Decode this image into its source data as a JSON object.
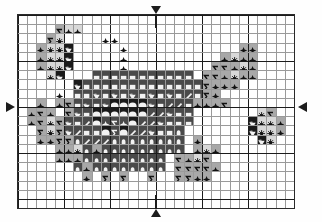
{
  "chart_type": "cross-stitch-pattern-chart",
  "title": "",
  "grid": {
    "columns": 30,
    "rows": 21,
    "cell_size_px": 9.2,
    "bold_line_every": 5,
    "grid_line_color": "#9a9a9a",
    "bold_line_color": "#1c1c1c",
    "background_color": "#ffffff"
  },
  "legend": {
    "symbols": [
      {
        "key": "star",
        "glyph": "four-pointed-star",
        "name": "star-symbol"
      },
      {
        "key": "sigma",
        "glyph": "sigma",
        "name": "sigma-symbol"
      },
      {
        "key": "flower",
        "glyph": "flower",
        "name": "flower-symbol"
      },
      {
        "key": "square",
        "glyph": "filled-square",
        "name": "square-symbol"
      },
      {
        "key": "heart",
        "glyph": "heart",
        "name": "heart-symbol"
      },
      {
        "key": "slash",
        "glyph": "diagonal-slash",
        "name": "slash-symbol"
      },
      {
        "key": "dot",
        "glyph": "filled-circle",
        "name": "dot-symbol"
      },
      {
        "key": "oval",
        "glyph": "filled-oval",
        "name": "oval-symbol"
      },
      {
        "key": "blank",
        "glyph": "empty",
        "name": "blank-cell"
      }
    ],
    "fills": [
      {
        "key": "w",
        "color": "#ffffff",
        "name": "fill-white"
      },
      {
        "key": "lg",
        "color": "#d8d8d8",
        "name": "fill-light-gray"
      },
      {
        "key": "mg",
        "color": "#a8a8a8",
        "name": "fill-medium-gray"
      },
      {
        "key": "dg",
        "color": "#4a4a4a",
        "name": "fill-dark-gray"
      },
      {
        "key": "bk",
        "color": "#1a1a1a",
        "name": "fill-black"
      }
    ]
  },
  "center_markers": [
    {
      "name": "center-marker-top",
      "direction": "down",
      "col": 15
    },
    {
      "name": "center-marker-bottom",
      "direction": "up",
      "col": 15
    },
    {
      "name": "center-marker-left",
      "direction": "right",
      "row": 10
    },
    {
      "name": "center-marker-right",
      "direction": "left",
      "row": 10
    }
  ],
  "chart_data": {
    "type": "heatmap",
    "xlabel": "",
    "ylabel": "",
    "rows": [
      "..............................",
      "..............................",
      "...lgS lgX lgX................",
      "..lgS lgF.....wX wX...........",
      ".lgX lgF lgF bkH....wX........",
      ".lgX lgF lgF bkH....wX........",
      ".lgX lgF lgF bkH..............",
      "..lgF bkH.....................",
      "..............................",
      "..............................",
      "..............................",
      "..............................",
      "..............................",
      "..............................",
      "..............................",
      "..............................",
      "..............................",
      "..............................",
      "..............................",
      "..............................",
      ".............................."
    ],
    "note": "Pattern cells are defined in grid.cells as [col,row,fill,symbol]"
  },
  "cells": [
    [
      4,
      1,
      "mg",
      "sigma"
    ],
    [
      5,
      1,
      "lg",
      "star"
    ],
    [
      6,
      1,
      "lg",
      "star"
    ],
    [
      3,
      2,
      "mg",
      "sigma"
    ],
    [
      4,
      2,
      "lg",
      "flower"
    ],
    [
      9,
      2,
      "w",
      "star"
    ],
    [
      10,
      2,
      "w",
      "star"
    ],
    [
      2,
      3,
      "mg",
      "star"
    ],
    [
      3,
      3,
      "lg",
      "flower"
    ],
    [
      4,
      3,
      "lg",
      "flower"
    ],
    [
      5,
      3,
      "bk",
      "heart"
    ],
    [
      11,
      3,
      "w",
      "star"
    ],
    [
      24,
      3,
      "mg",
      "star"
    ],
    [
      25,
      3,
      "mg",
      "star"
    ],
    [
      2,
      4,
      "mg",
      "star"
    ],
    [
      3,
      4,
      "lg",
      "flower"
    ],
    [
      4,
      4,
      "lg",
      "flower"
    ],
    [
      5,
      4,
      "bk",
      "heart"
    ],
    [
      11,
      4,
      "w",
      "star"
    ],
    [
      22,
      4,
      "mg",
      "star"
    ],
    [
      23,
      4,
      "lg",
      "flower"
    ],
    [
      24,
      4,
      "mg",
      "star"
    ],
    [
      25,
      4,
      "mg",
      "star"
    ],
    [
      2,
      5,
      "mg",
      "star"
    ],
    [
      3,
      5,
      "lg",
      "flower"
    ],
    [
      4,
      5,
      "lg",
      "flower"
    ],
    [
      5,
      5,
      "bk",
      "heart"
    ],
    [
      11,
      5,
      "w",
      "star"
    ],
    [
      21,
      5,
      "mg",
      "sigma"
    ],
    [
      22,
      5,
      "mg",
      "sigma"
    ],
    [
      23,
      5,
      "mg",
      "star"
    ],
    [
      24,
      5,
      "lg",
      "flower"
    ],
    [
      25,
      5,
      "mg",
      "star"
    ],
    [
      3,
      6,
      "lg",
      "flower"
    ],
    [
      4,
      6,
      "bk",
      "heart"
    ],
    [
      8,
      6,
      "dg",
      "square"
    ],
    [
      9,
      6,
      "dg",
      "square"
    ],
    [
      10,
      6,
      "dg",
      "square"
    ],
    [
      11,
      6,
      "dg",
      "square"
    ],
    [
      12,
      6,
      "dg",
      "square"
    ],
    [
      13,
      6,
      "dg",
      "square"
    ],
    [
      14,
      6,
      "dg",
      "square"
    ],
    [
      15,
      6,
      "dg",
      "square"
    ],
    [
      16,
      6,
      "dg",
      "square"
    ],
    [
      17,
      6,
      "dg",
      "square"
    ],
    [
      18,
      6,
      "dg",
      "square"
    ],
    [
      20,
      6,
      "mg",
      "sigma"
    ],
    [
      21,
      6,
      "mg",
      "sigma"
    ],
    [
      22,
      6,
      "mg",
      "star"
    ],
    [
      23,
      6,
      "lg",
      "flower"
    ],
    [
      24,
      6,
      "mg",
      "star"
    ],
    [
      25,
      6,
      "mg",
      "star"
    ],
    [
      6,
      7,
      "bk",
      "heart"
    ],
    [
      7,
      7,
      "dg",
      "square"
    ],
    [
      8,
      7,
      "dg",
      "square"
    ],
    [
      9,
      7,
      "dg",
      "square"
    ],
    [
      10,
      7,
      "dg",
      "square"
    ],
    [
      11,
      7,
      "dg",
      "square"
    ],
    [
      12,
      7,
      "dg",
      "square"
    ],
    [
      13,
      7,
      "dg",
      "square"
    ],
    [
      14,
      7,
      "dg",
      "square"
    ],
    [
      15,
      7,
      "dg",
      "square"
    ],
    [
      16,
      7,
      "dg",
      "square"
    ],
    [
      17,
      7,
      "dg",
      "square"
    ],
    [
      18,
      7,
      "dg",
      "square"
    ],
    [
      19,
      7,
      "dg",
      "square"
    ],
    [
      20,
      7,
      "mg",
      "sigma"
    ],
    [
      21,
      7,
      "mg",
      "star"
    ],
    [
      22,
      7,
      "mg",
      "star"
    ],
    [
      23,
      7,
      "mg",
      "star"
    ],
    [
      4,
      8,
      "w",
      "star"
    ],
    [
      6,
      8,
      "dg",
      "square"
    ],
    [
      7,
      8,
      "dg",
      "square"
    ],
    [
      8,
      8,
      "dg",
      "heart"
    ],
    [
      9,
      8,
      "dg",
      "square"
    ],
    [
      10,
      8,
      "dg",
      "heart"
    ],
    [
      11,
      8,
      "dg",
      "square"
    ],
    [
      12,
      8,
      "dg",
      "heart"
    ],
    [
      13,
      8,
      "dg",
      "square"
    ],
    [
      14,
      8,
      "dg",
      "heart"
    ],
    [
      15,
      8,
      "dg",
      "square"
    ],
    [
      16,
      8,
      "dg",
      "heart"
    ],
    [
      17,
      8,
      "dg",
      "square"
    ],
    [
      18,
      8,
      "dg",
      "slash"
    ],
    [
      19,
      8,
      "dg",
      "square"
    ],
    [
      20,
      8,
      "mg",
      "sigma"
    ],
    [
      21,
      8,
      "mg",
      "star"
    ],
    [
      2,
      9,
      "mg",
      "star"
    ],
    [
      4,
      9,
      "mg",
      "star"
    ],
    [
      5,
      9,
      "mg",
      "sigma"
    ],
    [
      6,
      9,
      "dg",
      "square"
    ],
    [
      7,
      9,
      "dg",
      "heart"
    ],
    [
      8,
      9,
      "dg",
      "square"
    ],
    [
      9,
      9,
      "dg",
      "heart"
    ],
    [
      10,
      9,
      "bk",
      "dot"
    ],
    [
      11,
      9,
      "bk",
      "dot"
    ],
    [
      12,
      9,
      "bk",
      "dot"
    ],
    [
      13,
      9,
      "bk",
      "dot"
    ],
    [
      14,
      9,
      "dg",
      "heart"
    ],
    [
      15,
      9,
      "dg",
      "square"
    ],
    [
      16,
      9,
      "dg",
      "slash"
    ],
    [
      17,
      9,
      "dg",
      "slash"
    ],
    [
      18,
      9,
      "dg",
      "square"
    ],
    [
      19,
      9,
      "mg",
      "star"
    ],
    [
      20,
      9,
      "mg",
      "star"
    ],
    [
      21,
      9,
      "mg",
      "star"
    ],
    [
      22,
      9,
      "mg",
      "sigma"
    ],
    [
      1,
      10,
      "mg",
      "star"
    ],
    [
      2,
      10,
      "mg",
      "sigma"
    ],
    [
      3,
      10,
      "mg",
      "star"
    ],
    [
      5,
      10,
      "mg",
      "sigma"
    ],
    [
      6,
      10,
      "dg",
      "heart"
    ],
    [
      7,
      10,
      "dg",
      "square"
    ],
    [
      8,
      10,
      "bk",
      "dot"
    ],
    [
      9,
      10,
      "bk",
      "dot"
    ],
    [
      10,
      10,
      "bk",
      "dot"
    ],
    [
      11,
      10,
      "bk",
      "dot"
    ],
    [
      12,
      10,
      "bk",
      "dot"
    ],
    [
      13,
      10,
      "bk",
      "dot"
    ],
    [
      14,
      10,
      "dg",
      "slash"
    ],
    [
      15,
      10,
      "dg",
      "slash"
    ],
    [
      16,
      10,
      "dg",
      "heart"
    ],
    [
      17,
      10,
      "dg",
      "square"
    ],
    [
      18,
      10,
      "dg",
      "square"
    ],
    [
      26,
      10,
      "lg",
      "flower"
    ],
    [
      27,
      10,
      "mg",
      "sigma"
    ],
    [
      1,
      11,
      "mg",
      "star"
    ],
    [
      2,
      11,
      "mg",
      "sigma"
    ],
    [
      3,
      11,
      "lg",
      "flower"
    ],
    [
      4,
      11,
      "mg",
      "sigma"
    ],
    [
      5,
      11,
      "dg",
      "heart"
    ],
    [
      6,
      11,
      "dg",
      "square"
    ],
    [
      7,
      11,
      "dg",
      "slash"
    ],
    [
      8,
      11,
      "bk",
      "dot"
    ],
    [
      9,
      11,
      "dg",
      "star"
    ],
    [
      10,
      11,
      "dg",
      "sigma"
    ],
    [
      11,
      11,
      "dg",
      "star"
    ],
    [
      12,
      11,
      "bk",
      "dot"
    ],
    [
      13,
      11,
      "dg",
      "slash"
    ],
    [
      14,
      11,
      "dg",
      "slash"
    ],
    [
      15,
      11,
      "dg",
      "heart"
    ],
    [
      16,
      11,
      "dg",
      "square"
    ],
    [
      17,
      11,
      "dg",
      "square"
    ],
    [
      18,
      11,
      "dg",
      "square"
    ],
    [
      25,
      11,
      "bk",
      "heart"
    ],
    [
      26,
      11,
      "lg",
      "flower"
    ],
    [
      27,
      11,
      "lg",
      "flower"
    ],
    [
      28,
      11,
      "mg",
      "star"
    ],
    [
      2,
      12,
      "mg",
      "sigma"
    ],
    [
      3,
      12,
      "lg",
      "flower"
    ],
    [
      4,
      12,
      "mg",
      "sigma"
    ],
    [
      5,
      12,
      "dg",
      "heart"
    ],
    [
      6,
      12,
      "dg",
      "slash"
    ],
    [
      7,
      12,
      "dg",
      "square"
    ],
    [
      8,
      12,
      "dg",
      "square"
    ],
    [
      9,
      12,
      "bk",
      "dot"
    ],
    [
      10,
      12,
      "dg",
      "sigma"
    ],
    [
      11,
      12,
      "bk",
      "dot"
    ],
    [
      12,
      12,
      "dg",
      "slash"
    ],
    [
      13,
      12,
      "dg",
      "slash"
    ],
    [
      14,
      12,
      "dg",
      "heart"
    ],
    [
      15,
      12,
      "dg",
      "square"
    ],
    [
      16,
      12,
      "dg",
      "square"
    ],
    [
      17,
      12,
      "dg",
      "oval"
    ],
    [
      25,
      12,
      "bk",
      "heart"
    ],
    [
      26,
      12,
      "lg",
      "flower"
    ],
    [
      27,
      12,
      "lg",
      "flower"
    ],
    [
      28,
      12,
      "mg",
      "star"
    ],
    [
      2,
      13,
      "mg",
      "star"
    ],
    [
      3,
      13,
      "mg",
      "star"
    ],
    [
      4,
      13,
      "mg",
      "sigma"
    ],
    [
      5,
      13,
      "mg",
      "sigma"
    ],
    [
      6,
      13,
      "dg",
      "oval"
    ],
    [
      7,
      13,
      "dg",
      "slash"
    ],
    [
      8,
      13,
      "dg",
      "slash"
    ],
    [
      9,
      13,
      "dg",
      "slash"
    ],
    [
      10,
      13,
      "dg",
      "oval"
    ],
    [
      11,
      13,
      "dg",
      "oval"
    ],
    [
      12,
      13,
      "dg",
      "oval"
    ],
    [
      13,
      13,
      "dg",
      "oval"
    ],
    [
      14,
      13,
      "dg",
      "oval"
    ],
    [
      15,
      13,
      "dg",
      "oval"
    ],
    [
      16,
      13,
      "dg",
      "oval"
    ],
    [
      17,
      13,
      "dg",
      "oval"
    ],
    [
      19,
      13,
      "mg",
      "star"
    ],
    [
      26,
      13,
      "bk",
      "heart"
    ],
    [
      27,
      13,
      "lg",
      "flower"
    ],
    [
      4,
      14,
      "mg",
      "star"
    ],
    [
      5,
      14,
      "mg",
      "star"
    ],
    [
      6,
      14,
      "lg",
      "flower"
    ],
    [
      7,
      14,
      "dg",
      "oval"
    ],
    [
      8,
      14,
      "mg",
      "star"
    ],
    [
      9,
      14,
      "dg",
      "oval"
    ],
    [
      10,
      14,
      "dg",
      "oval"
    ],
    [
      11,
      14,
      "dg",
      "oval"
    ],
    [
      12,
      14,
      "dg",
      "oval"
    ],
    [
      13,
      14,
      "dg",
      "oval"
    ],
    [
      14,
      14,
      "dg",
      "oval"
    ],
    [
      15,
      14,
      "dg",
      "oval"
    ],
    [
      16,
      14,
      "dg",
      "oval"
    ],
    [
      17,
      14,
      "dg",
      "oval"
    ],
    [
      19,
      14,
      "mg",
      "star"
    ],
    [
      20,
      14,
      "lg",
      "flower"
    ],
    [
      21,
      14,
      "mg",
      "star"
    ],
    [
      4,
      15,
      "mg",
      "star"
    ],
    [
      5,
      15,
      "mg",
      "star"
    ],
    [
      6,
      15,
      "mg",
      "star"
    ],
    [
      7,
      15,
      "dg",
      "oval"
    ],
    [
      8,
      15,
      "dg",
      "oval"
    ],
    [
      9,
      15,
      "dg",
      "oval"
    ],
    [
      10,
      15,
      "dg",
      "oval"
    ],
    [
      11,
      15,
      "dg",
      "oval"
    ],
    [
      12,
      15,
      "dg",
      "oval"
    ],
    [
      13,
      15,
      "dg",
      "oval"
    ],
    [
      14,
      15,
      "dg",
      "oval"
    ],
    [
      15,
      15,
      "dg",
      "oval"
    ],
    [
      17,
      15,
      "mg",
      "sigma"
    ],
    [
      18,
      15,
      "mg",
      "star"
    ],
    [
      19,
      15,
      "lg",
      "flower"
    ],
    [
      20,
      15,
      "mg",
      "sigma"
    ],
    [
      6,
      16,
      "dg",
      "oval"
    ],
    [
      7,
      16,
      "mg",
      "star"
    ],
    [
      8,
      16,
      "dg",
      "oval"
    ],
    [
      9,
      16,
      "dg",
      "oval"
    ],
    [
      10,
      16,
      "dg",
      "oval"
    ],
    [
      11,
      16,
      "dg",
      "oval"
    ],
    [
      12,
      16,
      "dg",
      "oval"
    ],
    [
      13,
      16,
      "dg",
      "oval"
    ],
    [
      14,
      16,
      "dg",
      "oval"
    ],
    [
      15,
      16,
      "dg",
      "oval"
    ],
    [
      17,
      16,
      "mg",
      "sigma"
    ],
    [
      18,
      16,
      "mg",
      "sigma"
    ],
    [
      19,
      16,
      "mg",
      "sigma"
    ],
    [
      20,
      16,
      "mg",
      "sigma"
    ],
    [
      21,
      16,
      "mg",
      "star"
    ],
    [
      7,
      17,
      "mg",
      "star"
    ],
    [
      9,
      17,
      "mg",
      "sigma"
    ],
    [
      11,
      17,
      "mg",
      "sigma"
    ],
    [
      14,
      17,
      "mg",
      "sigma"
    ],
    [
      17,
      17,
      "mg",
      "sigma"
    ],
    [
      18,
      17,
      "mg",
      "sigma"
    ],
    [
      19,
      17,
      "mg",
      "star"
    ],
    [
      20,
      17,
      "mg",
      "star"
    ]
  ]
}
